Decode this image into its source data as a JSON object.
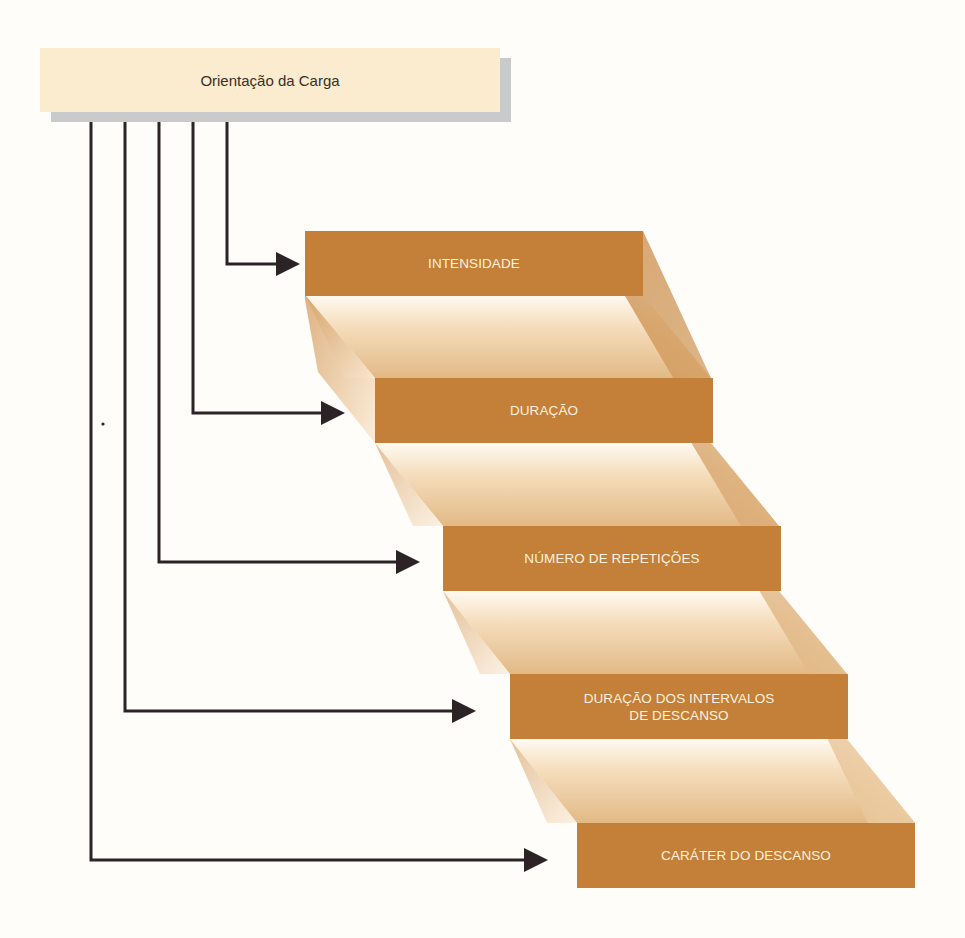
{
  "diagram": {
    "root": {
      "label": "Orientação da Carga",
      "fill": "#fbecd0",
      "shadow": "#c9cacc"
    },
    "steps": [
      {
        "label": "INTENSIDADE"
      },
      {
        "label": "DURAÇÃO"
      },
      {
        "label": "NÚMERO DE REPETIÇÕES"
      },
      {
        "label": "DURAÇÃO DOS INTERVALOS\nDE DESCANSO"
      },
      {
        "label": "CARÁTER DO DESCANSO"
      }
    ],
    "colors": {
      "step_fill": "#c47f38",
      "step_text": "#fdf2df",
      "connector": "#2b2326",
      "tread_light": "#fcefdc",
      "tread_dark": "#dcae76"
    }
  }
}
